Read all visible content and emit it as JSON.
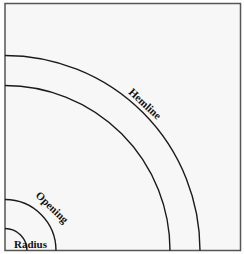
{
  "diagram": {
    "type": "quarter-circle skirt pattern",
    "labels": {
      "hemline": "Hemline",
      "opening": "Opening",
      "radius": "Radius"
    },
    "colors": {
      "background": "#f7f7f7",
      "frame": "#555555",
      "lines": "#1a1a1a",
      "text": "#111111"
    }
  }
}
